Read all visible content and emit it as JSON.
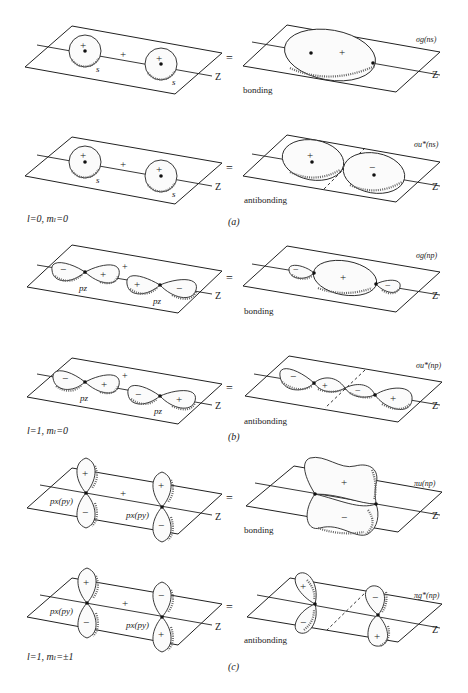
{
  "figure": {
    "panels": [
      {
        "id": "a",
        "caption": "(a)",
        "quantum_numbers": "l=0,  mₗ=0",
        "rows": [
          {
            "left": {
              "orbital_labels": [
                "s",
                "s"
              ],
              "lobe_signs": [
                "+",
                "+"
              ],
              "combine_sign": "+"
            },
            "equals": "=",
            "right": {
              "mo_label": "σg(ns)",
              "lobe_signs": [
                "+"
              ],
              "type": "bonding"
            },
            "type_label": "bonding"
          },
          {
            "left": {
              "orbital_labels": [
                "s",
                "s"
              ],
              "lobe_signs": [
                "+",
                "+"
              ],
              "combine_sign": "+"
            },
            "equals": "=",
            "right": {
              "mo_label": "σu*(ns)",
              "lobe_signs": [
                "+",
                "−"
              ],
              "type": "antibonding"
            },
            "type_label": "antibonding"
          }
        ]
      },
      {
        "id": "b",
        "caption": "(b)",
        "quantum_numbers": "l=1,  mₗ=0",
        "rows": [
          {
            "left": {
              "orbital_labels": [
                "pz",
                "pz"
              ],
              "lobe_signs": [
                "−",
                "+",
                "+",
                "−"
              ],
              "combine_sign": "+"
            },
            "equals": "=",
            "right": {
              "mo_label": "σg(np)",
              "lobe_signs": [
                "−",
                "+",
                "−"
              ],
              "type": "bonding"
            },
            "type_label": "bonding"
          },
          {
            "left": {
              "orbital_labels": [
                "pz",
                "pz"
              ],
              "lobe_signs": [
                "−",
                "+",
                "−",
                "+"
              ],
              "combine_sign": "+"
            },
            "equals": "=",
            "right": {
              "mo_label": "σu*(np)",
              "lobe_signs": [
                "−",
                "+",
                "−",
                "+"
              ],
              "type": "antibonding"
            },
            "type_label": "antibonding"
          }
        ]
      },
      {
        "id": "c",
        "caption": "(c)",
        "quantum_numbers": "l=1,  mₗ=±1",
        "rows": [
          {
            "left": {
              "orbital_labels": [
                "px(py)",
                "px(py)"
              ],
              "lobe_signs": [
                "+",
                "−",
                "+",
                "−"
              ],
              "combine_sign": "+"
            },
            "equals": "=",
            "right": {
              "mo_label": "πu(np)",
              "lobe_signs": [
                "+",
                "−"
              ],
              "type": "bonding"
            },
            "type_label": "bonding"
          },
          {
            "left": {
              "orbital_labels": [
                "px(py)",
                "px(py)"
              ],
              "lobe_signs": [
                "+",
                "−",
                "−",
                "+"
              ],
              "combine_sign": "+"
            },
            "equals": "=",
            "right": {
              "mo_label": "πg*(np)",
              "lobe_signs": [
                "+",
                "−",
                "−",
                "+"
              ],
              "type": "antibonding"
            },
            "type_label": "antibonding"
          }
        ]
      }
    ],
    "axis_label": "Z",
    "glyphs": {
      "plus": "+",
      "minus": "−",
      "equals": "="
    }
  }
}
